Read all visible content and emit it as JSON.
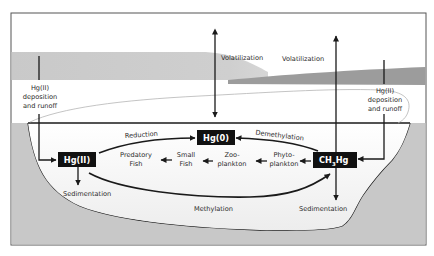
{
  "diagram": {
    "colors": {
      "frame": "#555555",
      "sky_band_light": "#cfcfcf",
      "sky_band_dark": "#9c9c9c",
      "sediment_fill": "#c8c8c8",
      "water_fill": "#f3f3f3",
      "box_fill": "#111111",
      "box_text": "#ffffff",
      "arrow": "#1a1a1a",
      "label_text": "#2b2b2b"
    },
    "species_boxes": {
      "hg2": "Hg(II)",
      "hg0": "Hg(0)",
      "ch3hg_main": "CH",
      "ch3hg_sub": "3",
      "ch3hg_tail": "Hg"
    },
    "labels": {
      "volatilization_left": "Volatilization",
      "volatilization_right": "Volatilization",
      "deposition_left_l1": "Hg(II)",
      "deposition_left_l2": "deposition",
      "deposition_left_l3": "and runoff",
      "deposition_right_l1": "Hg(II)",
      "deposition_right_l2": "deposition",
      "deposition_right_l3": "and runoff",
      "reduction": "Reduction",
      "demethylation": "Demethylation",
      "methylation": "Methylation",
      "sedimentation_left": "Sedimentation",
      "sedimentation_right": "Sedimentation"
    },
    "food_chain": [
      {
        "l1": "Predatory",
        "l2": "Fish"
      },
      {
        "l1": "Small",
        "l2": "Fish"
      },
      {
        "l1": "Zoo-",
        "l2": "plankton"
      },
      {
        "l1": "Phyto-",
        "l2": "plankton"
      }
    ],
    "edges": [
      {
        "from": "Hg(II)",
        "to": "Hg(0)",
        "label": "Reduction"
      },
      {
        "from": "CH3Hg",
        "to": "Hg(0)",
        "label": "Demethylation"
      },
      {
        "from": "Hg(II)",
        "to": "CH3Hg",
        "label": "Methylation"
      },
      {
        "from": "Hg(0)",
        "to": "atmosphere",
        "label": "Volatilization",
        "bidirectional": true
      },
      {
        "from": "CH3Hg",
        "to": "atmosphere",
        "label": "Volatilization"
      },
      {
        "from": "atmosphere",
        "to": "Hg(II)",
        "label": "Hg(II) deposition and runoff"
      },
      {
        "from": "atmosphere",
        "to": "CH3Hg",
        "label": "Hg(II) deposition and runoff"
      },
      {
        "from": "Hg(II)",
        "to": "sediment",
        "label": "Sedimentation"
      },
      {
        "from": "CH3Hg",
        "to": "sediment",
        "label": "Sedimentation"
      },
      {
        "from": "CH3Hg",
        "to": "Phyto-plankton"
      },
      {
        "from": "Phyto-plankton",
        "to": "Zoo-plankton"
      },
      {
        "from": "Zoo-plankton",
        "to": "Small Fish"
      },
      {
        "from": "Small Fish",
        "to": "Predatory Fish"
      }
    ]
  }
}
